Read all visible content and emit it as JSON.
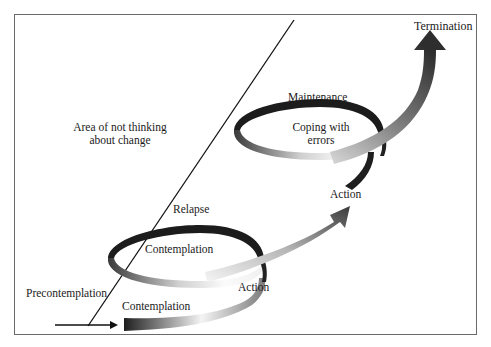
{
  "diagram": {
    "labels": {
      "termination": "Termination",
      "maintenance": "Maintenance",
      "coping_line1": "Coping with",
      "coping_line2": "errors",
      "area_line1": "Area of not thinking",
      "area_line2": "about change",
      "relapse": "Relapse",
      "contemplation_upper": "Contemplation",
      "action_upper": "Action",
      "action_lower": "Action",
      "precontemplation": "Precontemplation",
      "contemplation_lower": "Contemplation"
    },
    "colors": {
      "ribbon_dark": "#1e1e1e",
      "ribbon_light": "#f2f2f2",
      "ribbon_mid": "#8a8a8a",
      "frame": "#6a6a6a",
      "line": "#111111"
    },
    "stages": [
      "Precontemplation",
      "Contemplation",
      "Action",
      "Maintenance",
      "Relapse",
      "Termination"
    ]
  }
}
